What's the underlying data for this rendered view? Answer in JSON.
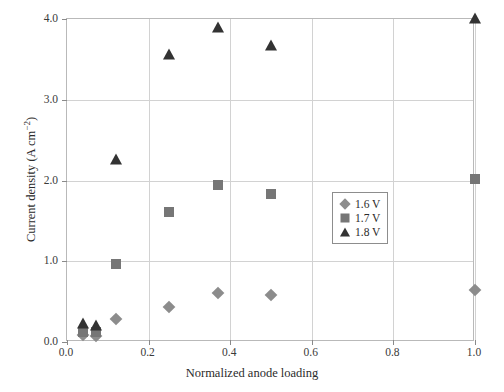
{
  "chart_data": {
    "type": "scatter",
    "title": "",
    "xlabel": "Normalized anode loading",
    "ylabel_text": "Current density (A cm",
    "ylabel_sup": "−2",
    "ylabel_tail": ")",
    "ylabel": "Current density (A cm−2)",
    "xlim": [
      0.0,
      1.0
    ],
    "ylim": [
      0.0,
      4.0
    ],
    "xticks": [
      "0.0",
      "0.2",
      "0.4",
      "0.6",
      "0.8",
      "1.0"
    ],
    "xtick_values": [
      0.0,
      0.2,
      0.4,
      0.6,
      0.8,
      1.0
    ],
    "yticks": [
      "0.0",
      "1.0",
      "2.0",
      "3.0",
      "4.0"
    ],
    "ytick_values": [
      0.0,
      1.0,
      2.0,
      3.0,
      4.0
    ],
    "grid": true,
    "legend_position": "center-right",
    "series": [
      {
        "name": "1.6 V",
        "marker": "diamond",
        "color": "#8c8c8c",
        "x": [
          0.04,
          0.07,
          0.12,
          0.25,
          0.37,
          0.5,
          1.0
        ],
        "y": [
          0.09,
          0.08,
          0.29,
          0.43,
          0.61,
          0.58,
          0.64
        ]
      },
      {
        "name": "1.7 V",
        "marker": "square",
        "color": "#767676",
        "x": [
          0.04,
          0.07,
          0.12,
          0.25,
          0.37,
          0.5,
          1.0
        ],
        "y": [
          0.13,
          0.12,
          0.97,
          1.61,
          1.95,
          1.83,
          2.02
        ]
      },
      {
        "name": "1.8 V",
        "marker": "triangle",
        "color": "#333333",
        "x": [
          0.04,
          0.07,
          0.12,
          0.25,
          0.37,
          0.5,
          1.0
        ],
        "y": [
          0.22,
          0.2,
          2.25,
          3.56,
          3.89,
          3.67,
          4.0
        ]
      }
    ]
  }
}
